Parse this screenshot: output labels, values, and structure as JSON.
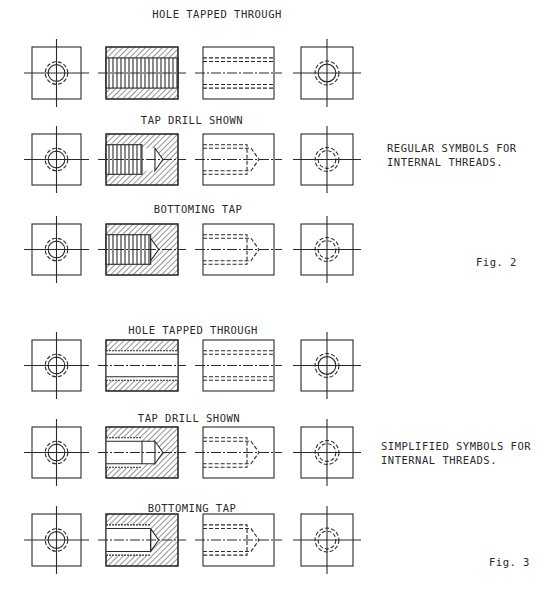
{
  "figures": [
    {
      "id": "fig2",
      "label": "Fig. 2",
      "caption_lines": [
        "REGULAR SYMBOLS FOR",
        "INTERNAL THREADS."
      ],
      "rows": [
        {
          "title": "HOLE TAPPED THROUGH"
        },
        {
          "title": "TAP DRILL SHOWN"
        },
        {
          "title": "BOTTOMING TAP"
        }
      ]
    },
    {
      "id": "fig3",
      "label": "Fig. 3",
      "caption_lines": [
        "SIMPLIFIED SYMBOLS FOR",
        "INTERNAL THREADS."
      ],
      "rows": [
        {
          "title": "HOLE TAPPED THROUGH"
        },
        {
          "title": "TAP  DRILL SHOWN"
        },
        {
          "title": "BOTTOMING TAP"
        }
      ]
    }
  ],
  "colors": {
    "ink": "#2a2a2a",
    "paper": "#ffffff"
  }
}
